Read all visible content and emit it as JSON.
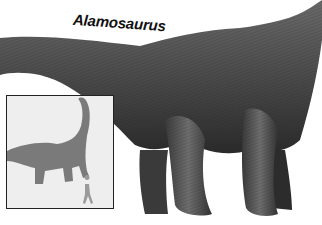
{
  "illustration": {
    "title": "Alamosaurus",
    "subject": "sauropod-dinosaur",
    "palette": {
      "background": "#ffffff",
      "body_dark": "#2e2e2e",
      "body_mid": "#5a5a5a",
      "body_light": "#8a8a8a",
      "inset_bg": "#eeeeee",
      "inset_silhouette": "#7a7a7a",
      "human_silhouette": "#9a9a9a",
      "inset_border": "#222222"
    },
    "inset": {
      "label": "",
      "contents": [
        "dinosaur-silhouette",
        "human-silhouette"
      ]
    }
  }
}
